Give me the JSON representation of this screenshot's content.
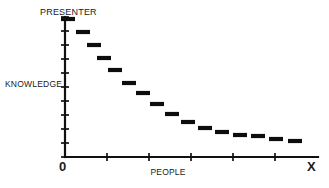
{
  "chart_data": {
    "type": "scatter",
    "title": "",
    "subtitle": "",
    "xlabel": "PEOPLE",
    "ylabel": "KNOWLEDGE",
    "y_axis_top_label": "PRESENTER",
    "x_origin_label": "0",
    "x_end_label": "X",
    "grid": false,
    "legend": null,
    "marker_style": "horizontal-dash",
    "series_color": "#0d0d0d",
    "axis_color": "#111111",
    "background_color": "#ffffff",
    "xlim": [
      0,
      16
    ],
    "ylim": [
      0,
      10
    ],
    "y_tick_count": 10,
    "x_tick_count": 5,
    "x": [
      0.5,
      1.5,
      2.5,
      3.5,
      4.5,
      5.5,
      6.5,
      7.5,
      8.5,
      9.5,
      10.5,
      11.5,
      12.5,
      13.5,
      14.5,
      15.4
    ],
    "values": [
      9.7,
      8.85,
      8.0,
      7.3,
      6.4,
      5.5,
      4.7,
      4.05,
      3.4,
      2.95,
      2.6,
      2.4,
      2.25,
      2.15,
      2.0,
      1.9
    ],
    "points": [
      {
        "x": 0.5,
        "y": 9.7,
        "px": 68,
        "py": 19
      },
      {
        "x": 1.5,
        "y": 8.85,
        "px": 83,
        "py": 32
      },
      {
        "x": 2.5,
        "y": 8.0,
        "px": 94,
        "py": 45
      },
      {
        "x": 3.5,
        "y": 7.3,
        "px": 104,
        "py": 58
      },
      {
        "x": 4.5,
        "y": 6.4,
        "px": 115,
        "py": 70
      },
      {
        "x": 5.5,
        "y": 5.5,
        "px": 129,
        "py": 83
      },
      {
        "x": 6.5,
        "y": 4.7,
        "px": 143,
        "py": 93
      },
      {
        "x": 7.5,
        "y": 4.05,
        "px": 157,
        "py": 104
      },
      {
        "x": 8.5,
        "y": 3.4,
        "px": 172,
        "py": 114
      },
      {
        "x": 9.5,
        "y": 2.95,
        "px": 188,
        "py": 122
      },
      {
        "x": 10.5,
        "y": 2.6,
        "px": 205,
        "py": 128
      },
      {
        "x": 11.5,
        "y": 2.4,
        "px": 222,
        "py": 132
      },
      {
        "x": 12.5,
        "y": 2.25,
        "px": 240,
        "py": 135
      },
      {
        "x": 13.5,
        "y": 2.15,
        "px": 258,
        "py": 136
      },
      {
        "x": 14.5,
        "y": 2.0,
        "px": 276,
        "py": 139
      },
      {
        "x": 15.4,
        "y": 1.9,
        "px": 295,
        "py": 141
      }
    ],
    "axis_geometry": {
      "y_axis_x": 65,
      "y_axis_top": 17,
      "y_axis_bottom": 157,
      "x_axis_y": 157,
      "x_axis_left": 65,
      "x_axis_right": 318,
      "y_tick_ys": [
        17,
        31,
        45,
        59,
        73,
        87,
        101,
        115,
        129,
        143,
        157
      ],
      "x_tick_xs": [
        107,
        149,
        191,
        233,
        275
      ],
      "tick_half_len": 4,
      "dash_half_width": 7
    }
  }
}
